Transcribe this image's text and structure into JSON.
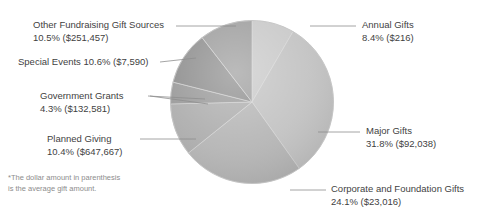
{
  "chart_data": {
    "type": "pie",
    "title": "",
    "legend_position": "callout-labels",
    "grid": false,
    "note": "*The dollar amount in parenthesis is the average gift amount.",
    "categories": [
      "Annual Gifts",
      "Major Gifts",
      "Corporate and Foundation Gifts",
      "Planned Giving",
      "Government Grants",
      "Special Events",
      "Other Fundraising Gift Sources"
    ],
    "values": [
      8.4,
      31.8,
      24.1,
      10.4,
      4.3,
      10.6,
      10.5
    ],
    "value_unit": "%",
    "average_gift_amounts": [
      216,
      92038,
      23016,
      647667,
      132581,
      7590,
      251457
    ],
    "slices": [
      {
        "label": "Annual Gifts",
        "percent": "8.4%",
        "amount": "($216)",
        "value": 8.4,
        "color": "#c9c9c9"
      },
      {
        "label": "Major Gifts",
        "percent": "31.8%",
        "amount": "($92,038)",
        "value": 31.8,
        "color": "#c3c3c3"
      },
      {
        "label": "Corporate and Foundation Gifts",
        "percent": "24.1%",
        "amount": "($23,016)",
        "value": 24.1,
        "color": "#b6b6b6"
      },
      {
        "label": "Planned Giving",
        "percent": "10.4%",
        "amount": "($647,667)",
        "value": 10.4,
        "color": "#aeaeae"
      },
      {
        "label": "Government Grants",
        "percent": "4.3%",
        "amount": "($132,581)",
        "value": 4.3,
        "color": "#9a9a9a"
      },
      {
        "label": "Special Events",
        "percent": "10.6%",
        "amount": "($7,590)",
        "value": 10.6,
        "color": "#8f8f8f"
      },
      {
        "label": "Other Fundraising Gift Sources",
        "percent": "10.5%",
        "amount": "($251,457)",
        "value": 10.5,
        "color": "#9e9e9e"
      }
    ]
  },
  "labels": {
    "other_fundraising": {
      "line1": "Other Fundraising Gift Sources",
      "line2": "10.5% ($251,457)"
    },
    "special_events": {
      "line1": "Special Events 10.6% ($7,590)"
    },
    "government_grants": {
      "line1": "Government Grants",
      "line2": "4.3% ($132,581)"
    },
    "planned_giving": {
      "line1": "Planned Giving",
      "line2": "10.4% ($647,667)"
    },
    "annual_gifts": {
      "line1": "Annual Gifts",
      "line2": "8.4% ($216)"
    },
    "major_gifts": {
      "line1": "Major Gifts",
      "line2": "31.8% ($92,038)"
    },
    "corporate_foundation": {
      "line1": "Corporate and Foundation Gifts",
      "line2": "24.1% ($23,016)"
    }
  },
  "footnote": {
    "line1": "*The dollar amount in parenthesis",
    "line2": "is the average gift amount."
  }
}
